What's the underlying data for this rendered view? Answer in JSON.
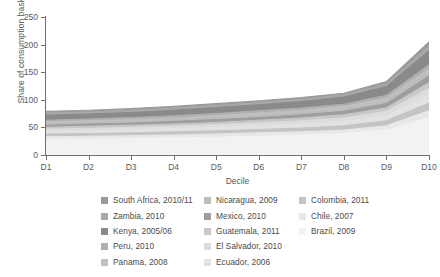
{
  "chart_data": {
    "type": "area",
    "title": "",
    "xlabel": "Decile",
    "ylabel": "Share of consumption basket",
    "categories": [
      "D1",
      "D2",
      "D3",
      "D4",
      "D5",
      "D6",
      "D7",
      "D8",
      "D9",
      "D10"
    ],
    "xlim": [
      "D1",
      "D10"
    ],
    "ylim": [
      0,
      250
    ],
    "yticks": [
      0,
      50,
      100,
      150,
      200,
      250
    ],
    "grid": false,
    "legend_position": "bottom",
    "legend_columns": 3,
    "series": [
      {
        "name": "South Africa, 2010/11",
        "color": "#9a9a9a",
        "values": [
          79,
          81,
          84,
          88,
          93,
          98,
          104,
          112,
          133,
          205
        ]
      },
      {
        "name": "Zambia, 2010",
        "color": "#a8a8a8",
        "values": [
          76,
          78,
          81,
          85,
          90,
          95,
          101,
          109,
          129,
          197
        ]
      },
      {
        "name": "Kenya, 2005/06",
        "color": "#8a8a8a",
        "values": [
          72,
          74,
          77,
          81,
          86,
          91,
          97,
          105,
          124,
          189
        ]
      },
      {
        "name": "Peru, 2010",
        "color": "#b0b0b0",
        "values": [
          63,
          65,
          68,
          71,
          75,
          80,
          85,
          92,
          108,
          163
        ]
      },
      {
        "name": "Panama, 2008",
        "color": "#c0c0c0",
        "values": [
          60,
          62,
          64,
          67,
          71,
          76,
          81,
          88,
          103,
          156
        ]
      },
      {
        "name": "Nicaragua, 2009",
        "color": "#bdbdbd",
        "values": [
          57,
          59,
          61,
          64,
          68,
          72,
          77,
          84,
          98,
          150
        ]
      },
      {
        "name": "Mexico, 2010",
        "color": "#9e9e9e",
        "values": [
          54,
          56,
          58,
          61,
          64,
          68,
          73,
          79,
          93,
          143
        ]
      },
      {
        "name": "Guatemala, 2011",
        "color": "#c8c8c8",
        "values": [
          50,
          52,
          54,
          56,
          59,
          63,
          67,
          73,
          85,
          131
        ]
      },
      {
        "name": "El Salvador, 2010",
        "color": "#dcdcdc",
        "values": [
          47,
          48,
          50,
          52,
          55,
          58,
          62,
          67,
          79,
          121
        ]
      },
      {
        "name": "Ecuador, 2006",
        "color": "#e2e2e2",
        "values": [
          43,
          44,
          46,
          48,
          50,
          53,
          56,
          61,
          71,
          109
        ]
      },
      {
        "name": "Colombia, 2011",
        "color": "#c4c4c4",
        "values": [
          38,
          39,
          40,
          42,
          44,
          46,
          49,
          53,
          62,
          94
        ]
      },
      {
        "name": "Chile, 2007",
        "color": "#e8e8e8",
        "values": [
          33,
          34,
          35,
          36,
          38,
          40,
          42,
          45,
          53,
          80
        ]
      },
      {
        "name": "Brazil, 2009",
        "color": "#f2f2f2",
        "values": [
          28,
          29,
          30,
          31,
          32,
          34,
          36,
          39,
          45,
          68
        ]
      }
    ]
  },
  "axes": {
    "y_title": "Share of consumption basket",
    "x_title": "Decile",
    "y_ticks": [
      "0",
      "50",
      "100",
      "150",
      "200",
      "250"
    ],
    "x_ticks": [
      "D1",
      "D2",
      "D3",
      "D4",
      "D5",
      "D6",
      "D7",
      "D8",
      "D9",
      "D10"
    ]
  },
  "legend": {
    "columns": [
      {
        "items": [
          {
            "label": "South Africa, 2010/11",
            "color": "#9a9a9a"
          },
          {
            "label": "Zambia, 2010",
            "color": "#a8a8a8"
          },
          {
            "label": "Kenya, 2005/06",
            "color": "#8a8a8a"
          },
          {
            "label": "Peru, 2010",
            "color": "#b0b0b0"
          },
          {
            "label": "Panama, 2008",
            "color": "#c0c0c0"
          }
        ]
      },
      {
        "items": [
          {
            "label": "Nicaragua, 2009",
            "color": "#bdbdbd"
          },
          {
            "label": "Mexico, 2010",
            "color": "#9e9e9e"
          },
          {
            "label": "Guatemala, 2011",
            "color": "#c8c8c8"
          },
          {
            "label": "El Salvador, 2010",
            "color": "#dcdcdc"
          },
          {
            "label": "Ecuador, 2006",
            "color": "#e2e2e2"
          }
        ]
      },
      {
        "items": [
          {
            "label": "Colombia, 2011",
            "color": "#c4c4c4"
          },
          {
            "label": "Chile, 2007",
            "color": "#e8e8e8"
          },
          {
            "label": "Brazil, 2009",
            "color": "#f2f2f2"
          }
        ]
      }
    ]
  }
}
